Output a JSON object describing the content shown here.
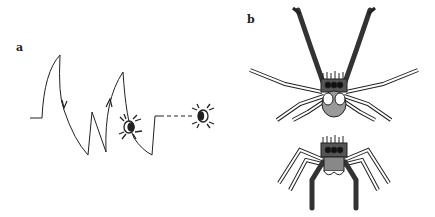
{
  "figure": {
    "panels": [
      {
        "label": "a",
        "content": "zig-zag approach path of spider toward a second spider",
        "elements": [
          "path-line",
          "direction-arrows",
          "dashed-segment",
          "spider-small",
          "spider-target"
        ]
      },
      {
        "label": "b",
        "content": "jumping spider display postures, front view",
        "elements": [
          "spider-legs-raised",
          "spider-legs-lowered"
        ]
      }
    ],
    "colors": {
      "ink": "#222222",
      "dark_leg": "#333333",
      "body_grey": "#9a9a9a",
      "background": "#ffffff"
    }
  }
}
